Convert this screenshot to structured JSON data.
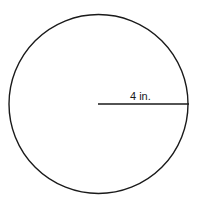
{
  "diagram": {
    "shape": "circle",
    "radius_label": "4 in.",
    "radius_value": 4,
    "radius_unit": "in.",
    "stroke_color": "#1a1a1a",
    "background_color": "#ffffff"
  }
}
